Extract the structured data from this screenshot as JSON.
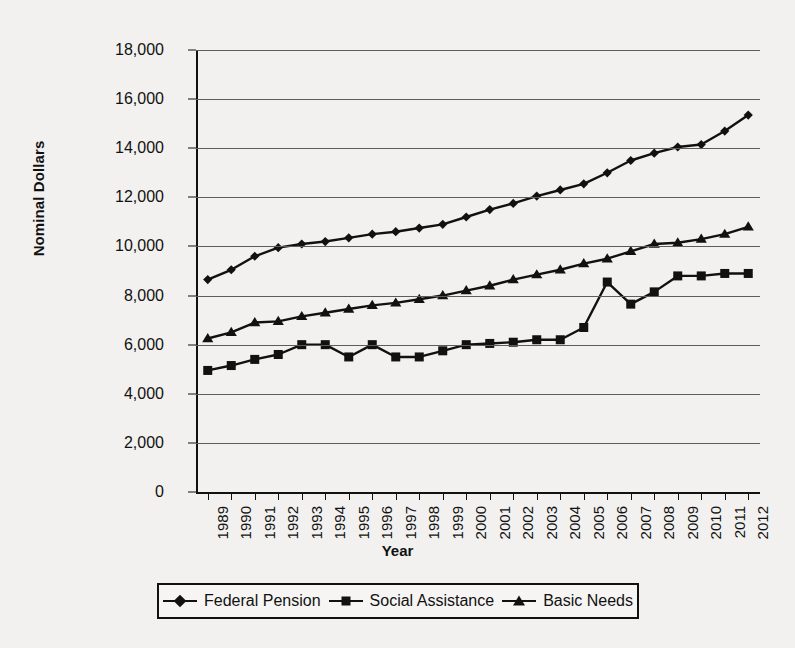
{
  "chart_data": {
    "type": "line",
    "title": "",
    "xlabel": "Year",
    "ylabel": "Nominal Dollars",
    "ylim": [
      0,
      18000
    ],
    "yticks": [
      "0",
      "2,000",
      "4,000",
      "6,000",
      "8,000",
      "10,000",
      "12,000",
      "14,000",
      "16,000",
      "18,000"
    ],
    "ytick_values": [
      0,
      2000,
      4000,
      6000,
      8000,
      10000,
      12000,
      14000,
      16000,
      18000
    ],
    "grid": "horizontal",
    "legend_position": "below-plot",
    "categories": [
      "1989",
      "1990",
      "1991",
      "1992",
      "1993",
      "1994",
      "1995",
      "1996",
      "1997",
      "1998",
      "1999",
      "2000",
      "2001",
      "2002",
      "2003",
      "2004",
      "2005",
      "2006",
      "2007",
      "2008",
      "2009",
      "2010",
      "2011",
      "2012"
    ],
    "series": [
      {
        "name": "Federal Pension",
        "marker": "diamond",
        "color": "#111111",
        "values": [
          8650,
          9050,
          9600,
          9950,
          10100,
          10200,
          10350,
          10500,
          10600,
          10750,
          10900,
          11200,
          11500,
          11750,
          12050,
          12300,
          12550,
          13000,
          13500,
          13800,
          14050,
          14150,
          14700,
          15350
        ]
      },
      {
        "name": "Social Assistance",
        "marker": "square",
        "color": "#111111",
        "values": [
          4950,
          5150,
          5400,
          5600,
          6000,
          6000,
          5500,
          6000,
          5500,
          5500,
          5750,
          6000,
          6050,
          6100,
          6200,
          6200,
          6700,
          8550,
          7650,
          8150,
          8800,
          8800,
          8900,
          8900
        ]
      },
      {
        "name": "Basic Needs",
        "marker": "triangle",
        "color": "#111111",
        "values": [
          6250,
          6500,
          6900,
          6950,
          7150,
          7300,
          7450,
          7600,
          7700,
          7850,
          8000,
          8200,
          8400,
          8650,
          8850,
          9050,
          9300,
          9500,
          9800,
          10100,
          10150,
          10300,
          10500,
          10800
        ]
      }
    ]
  },
  "legend": {
    "entries": [
      {
        "label": "Federal Pension",
        "marker": "diamond-marker"
      },
      {
        "label": "Social Assistance",
        "marker": "square-marker"
      },
      {
        "label": "Basic Needs",
        "marker": "triangle-marker"
      }
    ]
  }
}
